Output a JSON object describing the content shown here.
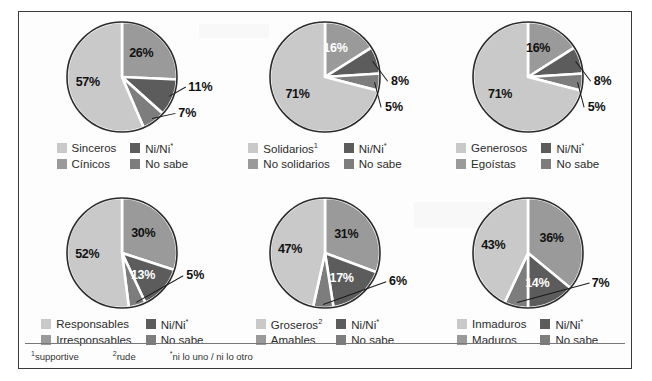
{
  "colors": {
    "light": "#c9c9c9",
    "medium": "#9a9a9a",
    "dark": "#5c5c5c",
    "middark": "#7d7d7d",
    "outline": "#2b2b2b",
    "gap": "#ffffff"
  },
  "footnotes": [
    {
      "marker": "1",
      "text": "supportive"
    },
    {
      "marker": "2",
      "text": "rude"
    },
    {
      "marker": "*",
      "text": "ni lo uno / ni lo otro"
    }
  ],
  "chart_data": [
    {
      "type": "pie",
      "title": "",
      "categories": [
        "Sinceros",
        "Cínicos",
        "Ni/Ni*",
        "No sabe"
      ],
      "values": [
        57,
        26,
        11,
        7
      ],
      "labels": [
        "57%",
        "26%",
        "11%",
        "7%"
      ],
      "legend": [
        {
          "label": "Sinceros",
          "sup": "",
          "color": "light"
        },
        {
          "label": "Ni/Ni",
          "sup": "*",
          "color": "dark"
        },
        {
          "label": "Cínicos",
          "sup": "",
          "color": "medium"
        },
        {
          "label": "No sabe",
          "sup": "",
          "color": "middark"
        }
      ]
    },
    {
      "type": "pie",
      "title": "",
      "categories": [
        "Solidarios",
        "No solidarios",
        "Ni/Ni*",
        "No sabe"
      ],
      "values": [
        71,
        16,
        8,
        5
      ],
      "labels": [
        "71%",
        "16%",
        "8%",
        "5%"
      ],
      "legend": [
        {
          "label": "Solidarios",
          "sup": "1",
          "color": "light"
        },
        {
          "label": "Ni/Ni",
          "sup": "*",
          "color": "dark"
        },
        {
          "label": "No solidarios",
          "sup": "",
          "color": "medium"
        },
        {
          "label": "No sabe",
          "sup": "",
          "color": "middark"
        }
      ]
    },
    {
      "type": "pie",
      "title": "",
      "categories": [
        "Generosos",
        "Egoístas",
        "Ni/Ni*",
        "No sabe"
      ],
      "values": [
        71,
        16,
        8,
        5
      ],
      "labels": [
        "71%",
        "16%",
        "8%",
        "5%"
      ],
      "legend": [
        {
          "label": "Generosos",
          "sup": "",
          "color": "light"
        },
        {
          "label": "Ni/Ni",
          "sup": "*",
          "color": "dark"
        },
        {
          "label": "Egoístas",
          "sup": "",
          "color": "medium"
        },
        {
          "label": "No sabe",
          "sup": "",
          "color": "middark"
        }
      ]
    },
    {
      "type": "pie",
      "title": "",
      "categories": [
        "Responsables",
        "Irresponsables",
        "Ni/Ni*",
        "No sabe"
      ],
      "values": [
        52,
        30,
        13,
        5
      ],
      "labels": [
        "52%",
        "30%",
        "13%",
        "5%"
      ],
      "legend": [
        {
          "label": "Responsables",
          "sup": "",
          "color": "light"
        },
        {
          "label": "Ni/Ni",
          "sup": "*",
          "color": "dark"
        },
        {
          "label": "Irresponsables",
          "sup": "",
          "color": "medium"
        },
        {
          "label": "No sabe",
          "sup": "",
          "color": "middark"
        }
      ]
    },
    {
      "type": "pie",
      "title": "",
      "categories": [
        "Groseros",
        "Amables",
        "Ni/Ni*",
        "No sabe"
      ],
      "values": [
        47,
        31,
        17,
        6
      ],
      "labels": [
        "47%",
        "31%",
        "17%",
        "6%"
      ],
      "legend": [
        {
          "label": "Groseros",
          "sup": "2",
          "color": "light"
        },
        {
          "label": "Ni/Ni",
          "sup": "*",
          "color": "dark"
        },
        {
          "label": "Amables",
          "sup": "",
          "color": "medium"
        },
        {
          "label": "No sabe",
          "sup": "",
          "color": "middark"
        }
      ]
    },
    {
      "type": "pie",
      "title": "",
      "categories": [
        "Inmaduros",
        "Maduros",
        "Ni/Ni*",
        "No sabe"
      ],
      "values": [
        43,
        36,
        14,
        7
      ],
      "labels": [
        "43%",
        "36%",
        "14%",
        "7%"
      ],
      "legend": [
        {
          "label": "Inmaduros",
          "sup": "",
          "color": "light"
        },
        {
          "label": "Ni/Ni",
          "sup": "*",
          "color": "dark"
        },
        {
          "label": "Maduros",
          "sup": "",
          "color": "medium"
        },
        {
          "label": "No sabe",
          "sup": "",
          "color": "middark"
        }
      ]
    }
  ]
}
